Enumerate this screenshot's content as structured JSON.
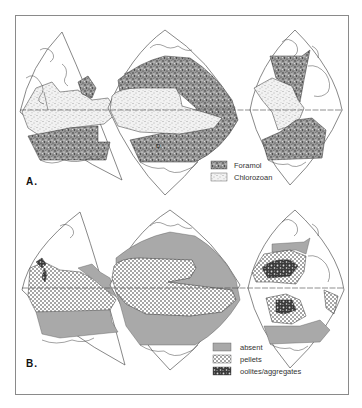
{
  "figure": {
    "panels": [
      {
        "id": "A",
        "label": "A.",
        "legend": [
          {
            "key": "foramol",
            "label": "Foramol",
            "pattern": "dense-stipple"
          },
          {
            "key": "chlorozoan",
            "label": "Chlorozoan",
            "pattern": "light-stipple"
          }
        ]
      },
      {
        "id": "B",
        "label": "B.",
        "legend": [
          {
            "key": "absent",
            "label": "absent",
            "pattern": "gray-fill"
          },
          {
            "key": "pellets",
            "label": "pellets",
            "pattern": "dot-grid"
          },
          {
            "key": "ooids",
            "label": "oolites/aggregates",
            "pattern": "dark-mottle"
          }
        ]
      }
    ],
    "colors": {
      "frame": "#8a8a8a",
      "outline": "#555555",
      "coast": "#444444",
      "gray_fill": "#a9a9a9",
      "ink": "#111111"
    }
  }
}
